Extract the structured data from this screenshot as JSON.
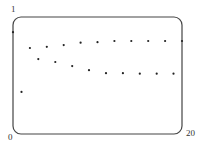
{
  "chart_data": {
    "type": "scatter",
    "title": "",
    "xlabel": "",
    "ylabel": "",
    "xlim": [
      0,
      20
    ],
    "ylim": [
      0,
      1
    ],
    "grid": false,
    "legend": null,
    "tick_labels": {
      "x_min": "0",
      "x_max": "20",
      "y_max": "1"
    },
    "x": [
      0,
      1,
      2,
      3,
      4,
      5,
      6,
      7,
      8,
      9,
      10,
      11,
      12,
      13,
      14,
      15,
      16,
      17,
      18,
      19,
      20
    ],
    "series": [
      {
        "name": "sequence",
        "values": [
          0.87,
          0.36,
          0.735,
          0.64,
          0.745,
          0.615,
          0.76,
          0.58,
          0.78,
          0.545,
          0.785,
          0.52,
          0.795,
          0.52,
          0.795,
          0.515,
          0.795,
          0.515,
          0.795,
          0.515,
          0.795
        ]
      }
    ]
  },
  "labels": {
    "y_top": "1",
    "x_left": "0",
    "x_right": "20"
  },
  "colors": {
    "frame": "#444444",
    "point": "#222222"
  }
}
